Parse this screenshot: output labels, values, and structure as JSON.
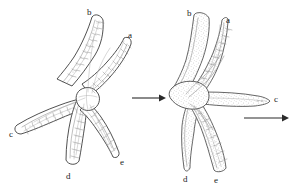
{
  "figure": {
    "background_color": "#ffffff",
    "ink_color": "#3c3c3c",
    "stipple_color": "#a0a0a0",
    "width": 291,
    "height": 194
  },
  "panels": [
    {
      "id": "left-panel",
      "name": "relaxed-starfish",
      "description": "Sea star with five arms spread outward, dorsal surface toward viewer",
      "arm_labels": [
        {
          "key": "a",
          "text": "a",
          "x": 128,
          "y": 31
        },
        {
          "key": "b",
          "text": "b",
          "x": 87,
          "y": 8
        },
        {
          "key": "c",
          "text": "c",
          "x": 9,
          "y": 130
        },
        {
          "key": "d",
          "text": "d",
          "x": 66,
          "y": 172
        },
        {
          "key": "e",
          "text": "e",
          "x": 120,
          "y": 158
        }
      ]
    },
    {
      "id": "right-panel",
      "name": "contracted-starfish",
      "description": "Same sea star with arms folded together, moving toward arm c",
      "arm_labels": [
        {
          "key": "a",
          "text": "a",
          "x": 226,
          "y": 16
        },
        {
          "key": "b",
          "text": "b",
          "x": 187,
          "y": 9
        },
        {
          "key": "c",
          "text": "c",
          "x": 274,
          "y": 95
        },
        {
          "key": "d",
          "text": "d",
          "x": 183,
          "y": 175
        },
        {
          "key": "e",
          "text": "e",
          "x": 214,
          "y": 176
        }
      ]
    }
  ],
  "arrows": [
    {
      "id": "transition-arrow",
      "name": "transition-arrow",
      "meaning": "change of posture",
      "x1": 132,
      "y1": 98,
      "x2": 163,
      "y2": 98
    },
    {
      "id": "direction-arrow",
      "name": "direction-of-movement-arrow",
      "meaning": "direction of movement",
      "x1": 244,
      "y1": 118,
      "x2": 286,
      "y2": 118
    }
  ]
}
